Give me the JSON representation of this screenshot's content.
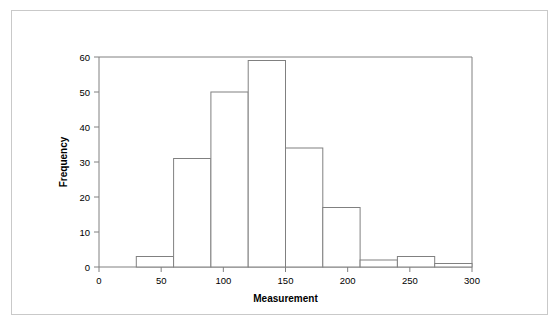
{
  "chart_data": {
    "type": "bar",
    "title": "",
    "subtitle": "",
    "xlabel": "Measurement",
    "ylabel": "Frequency",
    "xlim": [
      0,
      300
    ],
    "ylim": [
      0,
      60
    ],
    "xticks": [
      0,
      50,
      100,
      150,
      200,
      250,
      300
    ],
    "yticks": [
      0,
      10,
      20,
      30,
      40,
      50,
      60
    ],
    "xtick_labels": [
      "0",
      "50",
      "100",
      "150",
      "200",
      "250",
      "300"
    ],
    "ytick_labels": [
      "0",
      "10",
      "20",
      "30",
      "40",
      "50",
      "60"
    ],
    "grid": false,
    "legend": null,
    "bin_width": 30,
    "bin_edges": [
      30,
      60,
      90,
      120,
      150,
      180,
      210,
      240,
      270,
      300
    ],
    "categories": [
      "30-60",
      "60-90",
      "90-120",
      "120-150",
      "150-180",
      "180-210",
      "210-240",
      "240-270",
      "270-300"
    ],
    "values": [
      3,
      31,
      50,
      59,
      34,
      17,
      2,
      3,
      1
    ],
    "bar_fill_color": "#ffffff",
    "bar_edge_color": "#808080",
    "axis_color": "#808080",
    "text_color": "#000000",
    "background_color": "#ffffff",
    "outer_border_color": "#c9c9c9"
  },
  "figure": {
    "outer_border_label": "figure-border"
  }
}
